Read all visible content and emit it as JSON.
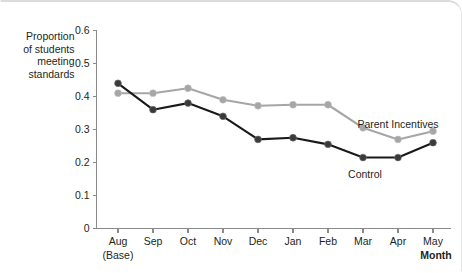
{
  "chart_data": {
    "type": "line",
    "title": "",
    "xlabel": "Month",
    "ylabel": "Proportion of students meeting standards",
    "ylabel_lines": [
      "Proportion",
      "of students",
      "meeting",
      "standards"
    ],
    "categories": [
      "Aug",
      "Sep",
      "Oct",
      "Nov",
      "Dec",
      "Jan",
      "Feb",
      "Mar",
      "Apr",
      "May"
    ],
    "category_sublabels": [
      "(Base)",
      "",
      "",
      "",
      "",
      "",
      "",
      "",
      "",
      ""
    ],
    "x_tick_labels": [
      "Aug",
      "Sep",
      "Oct",
      "Nov",
      "Dec",
      "Jan",
      "Feb",
      "Mar",
      "Apr",
      "May"
    ],
    "y_tick_labels": [
      "0",
      "0.1",
      "0.2",
      "0.3",
      "0.4",
      "0.5",
      "0.6"
    ],
    "y_tick_values": [
      0,
      0.1,
      0.2,
      0.3,
      0.4,
      0.5,
      0.6
    ],
    "ylim": [
      0,
      0.6
    ],
    "grid": false,
    "legend_position": "inline-annotation",
    "series": [
      {
        "name": "Parent Incentives",
        "color": "#a6a6a6",
        "label_x_category": "Apr",
        "values": [
          0.41,
          0.41,
          0.425,
          0.39,
          0.372,
          0.375,
          0.375,
          0.305,
          0.27,
          0.295
        ]
      },
      {
        "name": "Control",
        "color": "#1a1a1a",
        "label_x_category": "Mar",
        "values": [
          0.44,
          0.36,
          0.38,
          0.34,
          0.27,
          0.275,
          0.255,
          0.215,
          0.215,
          0.26
        ]
      }
    ]
  }
}
